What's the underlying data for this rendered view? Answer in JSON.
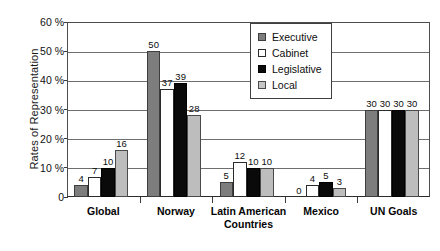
{
  "chart_data": {
    "type": "bar",
    "title": "",
    "xlabel": "",
    "ylabel": "Rates of Representation",
    "ylim": [
      0,
      60
    ],
    "ytick_labels": [
      "0",
      "10 %",
      "20 %",
      "30 %",
      "40 %",
      "50 %",
      "60 %"
    ],
    "ytick_values": [
      0,
      10,
      20,
      30,
      40,
      50,
      60
    ],
    "grid": true,
    "legend_position": "top-center",
    "categories": [
      "Global",
      "Norway",
      "Latin American Countries",
      "Mexico",
      "UN Goals"
    ],
    "category_label_lines": [
      [
        "Global"
      ],
      [
        "Norway"
      ],
      [
        "Latin American",
        "Countries"
      ],
      [
        "Mexico"
      ],
      [
        "UN Goals"
      ]
    ],
    "series": [
      {
        "name": "Executive",
        "color": "#7d7d7d",
        "values": [
          4,
          50,
          5,
          0,
          30
        ]
      },
      {
        "name": "Cabinet",
        "color": "#ffffff",
        "values": [
          7,
          37,
          12,
          4,
          30
        ]
      },
      {
        "name": "Legislative",
        "color": "#0a0a0a",
        "values": [
          10,
          39,
          10,
          5,
          30
        ]
      },
      {
        "name": "Local",
        "color": "#bdbdbd",
        "values": [
          16,
          28,
          10,
          3,
          30
        ]
      }
    ],
    "value_labels": [
      [
        "4",
        "7",
        "10",
        "16"
      ],
      [
        "50",
        "37",
        "39",
        "28"
      ],
      [
        "5",
        "12",
        "10",
        "10"
      ],
      [
        "0",
        "4",
        "5",
        "3"
      ],
      [
        "30",
        "30",
        "30",
        "30"
      ]
    ]
  },
  "legend": {
    "items": [
      {
        "label": "Executive",
        "swatch": "executive"
      },
      {
        "label": "Cabinet",
        "swatch": "cabinet"
      },
      {
        "label": "Legislative",
        "swatch": "legislative"
      },
      {
        "label": "Local",
        "swatch": "local"
      }
    ]
  }
}
